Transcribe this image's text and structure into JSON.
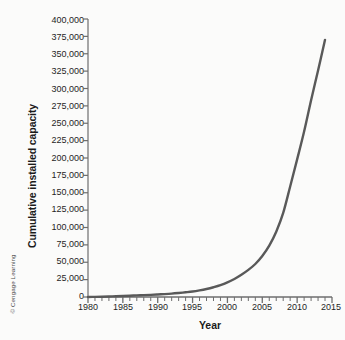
{
  "figure": {
    "credit": "© Cengage Learning",
    "background_color": "#fbfbfa",
    "axis_color": "#6e6e6e",
    "line_color": "#595959"
  },
  "chart_data": {
    "type": "line",
    "title": "",
    "xlabel": "Year",
    "ylabel": "Cumulative installed capacity",
    "xlim": [
      1980,
      2015
    ],
    "ylim": [
      0,
      400000
    ],
    "grid": false,
    "legend": null,
    "x_major_step": 5,
    "x_minor_step": 1,
    "y_major_step": 25000,
    "xticklabels": [
      "1980",
      "1985",
      "1990",
      "1995",
      "2000",
      "2005",
      "2010",
      "2015"
    ],
    "xtickvalues": [
      1980,
      1985,
      1990,
      1995,
      2000,
      2005,
      2010,
      2015
    ],
    "yticklabels": [
      "400,000",
      "375,000",
      "350,000",
      "325,000",
      "300,000",
      "275,000",
      "250,000",
      "225,000",
      "200,000",
      "175,000",
      "150,000",
      "125,000",
      "100,000",
      "75,000",
      "50,000",
      "25,000",
      "0"
    ],
    "ytickvalues": [
      400000,
      375000,
      350000,
      325000,
      300000,
      275000,
      250000,
      225000,
      200000,
      175000,
      150000,
      125000,
      100000,
      75000,
      50000,
      25000,
      0
    ],
    "series": [
      {
        "name": "Cumulative installed capacity",
        "color": "#595959",
        "x": [
          1980,
          1981,
          1982,
          1983,
          1984,
          1985,
          1986,
          1987,
          1988,
          1989,
          1990,
          1991,
          1992,
          1993,
          1994,
          1995,
          1996,
          1997,
          1998,
          1999,
          2000,
          2001,
          2002,
          2003,
          2004,
          2005,
          2006,
          2007,
          2008,
          2009,
          2010,
          2011,
          2012,
          2013,
          2014
        ],
        "values": [
          100,
          200,
          400,
          700,
          1100,
          1500,
          1900,
          2300,
          2700,
          3100,
          3600,
          4200,
          4900,
          5800,
          6800,
          7900,
          9500,
          11500,
          14000,
          17000,
          21000,
          26000,
          32000,
          39000,
          47500,
          59000,
          74000,
          94000,
          121000,
          159000,
          198000,
          238000,
          283000,
          326000,
          370000
        ]
      }
    ],
    "annotations": []
  }
}
